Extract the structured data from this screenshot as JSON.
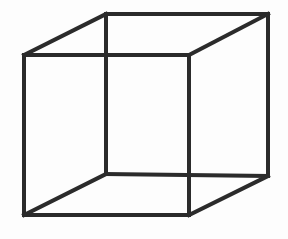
{
  "figure": {
    "name": "Necker cube",
    "type": "wireframe-line-drawing",
    "caption": "",
    "canvas": {
      "width": 288,
      "height": 239
    },
    "background_color": "#fdfdfd",
    "stroke_color": "#2b2b2b",
    "stroke_width": 4,
    "vertices": {
      "front_top_left": {
        "x": 24,
        "y": 55
      },
      "front_top_right": {
        "x": 189,
        "y": 55
      },
      "front_bottom_right": {
        "x": 189,
        "y": 215
      },
      "front_bottom_left": {
        "x": 24,
        "y": 215
      },
      "back_top_left": {
        "x": 106,
        "y": 14
      },
      "back_top_right": {
        "x": 268,
        "y": 14
      },
      "back_bottom_right": {
        "x": 268,
        "y": 176
      },
      "back_bottom_left": {
        "x": 106,
        "y": 174
      }
    },
    "edges": [
      {
        "id": "front-top",
        "label": "front top edge",
        "d": "M 24 55 L 189 55"
      },
      {
        "id": "front-right",
        "label": "front right edge",
        "d": "M 189 55 L 189 215"
      },
      {
        "id": "front-bottom",
        "label": "front bottom edge",
        "d": "M 189 215 L 24 215"
      },
      {
        "id": "front-left",
        "label": "front left edge",
        "d": "M 24 215 L 24 55"
      },
      {
        "id": "back-top",
        "label": "back top edge",
        "d": "M 106 14 L 268 14"
      },
      {
        "id": "back-right",
        "label": "back right edge",
        "d": "M 268 14 L 268 176"
      },
      {
        "id": "back-bottom",
        "label": "back bottom edge",
        "d": "M 268 176 L 106 174"
      },
      {
        "id": "back-left",
        "label": "back left edge",
        "d": "M 106 174 L 106 14"
      },
      {
        "id": "connect-top-left",
        "label": "top left connecting edge",
        "d": "M 24 55 L 106 14"
      },
      {
        "id": "connect-top-right",
        "label": "top right connecting edge",
        "d": "M 189 55 L 268 14"
      },
      {
        "id": "connect-bottom-right",
        "label": "bottom right connecting edge",
        "d": "M 189 215 L 268 176"
      },
      {
        "id": "connect-bottom-left",
        "label": "bottom left connecting edge",
        "d": "M 24 215 L 106 174"
      }
    ]
  }
}
